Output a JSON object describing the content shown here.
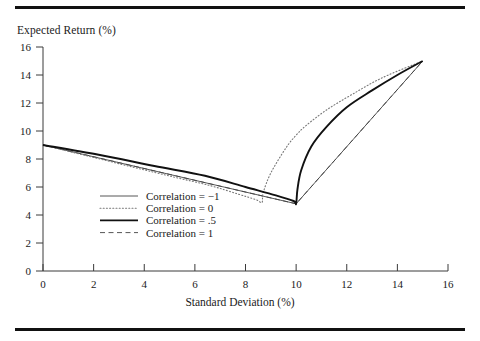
{
  "figure": {
    "title": "",
    "ylabel": "Expected Return (%)",
    "xlabel": "Standard Deviation (%)"
  },
  "legend": {
    "items": [
      {
        "label": "Correlation = −1",
        "style": "thin-solid",
        "key": "neg1"
      },
      {
        "label": "Correlation = 0",
        "style": "dotted",
        "key": "zero"
      },
      {
        "label": "Correlation = .5",
        "style": "thick-solid",
        "key": "half"
      },
      {
        "label": "Correlation = 1",
        "style": "dashed",
        "key": "one"
      }
    ]
  },
  "chart_data": {
    "type": "line",
    "title": "",
    "xlabel": "Standard Deviation (%)",
    "ylabel": "Expected Return (%)",
    "xlim": [
      0,
      16
    ],
    "ylim": [
      0,
      16
    ],
    "xticks": [
      0,
      2,
      4,
      6,
      8,
      10,
      12,
      14,
      16
    ],
    "yticks": [
      0,
      2,
      4,
      6,
      8,
      10,
      12,
      14,
      16
    ],
    "grid": false,
    "legend_position": "center-left",
    "endpoints": {
      "asset_a": {
        "x": 0,
        "y": 9
      },
      "asset_b": {
        "x": 15,
        "y": 15
      },
      "kink": {
        "x": 10,
        "y": 4.8
      }
    },
    "series": [
      {
        "name": "Correlation = −1",
        "style": "thin-solid",
        "x": [
          0,
          10,
          15
        ],
        "y": [
          9,
          4.8,
          15
        ]
      },
      {
        "name": "Correlation = 0",
        "style": "dotted",
        "x": [
          0,
          1.8,
          3.6,
          5.2,
          6.6,
          7.7,
          8.4,
          8.65,
          8.7,
          9.0,
          9.6,
          10.0,
          10.4,
          11.2,
          12.2,
          13.4,
          15
        ],
        "y": [
          9,
          8.2,
          7.4,
          6.7,
          6.1,
          5.5,
          5.1,
          4.9,
          5.6,
          7.0,
          8.8,
          9.7,
          10.4,
          11.5,
          12.6,
          13.8,
          15
        ]
      },
      {
        "name": "Correlation = .5",
        "style": "thick-solid",
        "x": [
          0,
          2.2,
          4.4,
          6.4,
          8.0,
          9.2,
          9.9,
          10.0,
          10.05,
          10.2,
          10.6,
          11.2,
          12.0,
          13.0,
          14.0,
          15
        ],
        "y": [
          9,
          8.3,
          7.5,
          6.8,
          6.0,
          5.4,
          5.0,
          4.8,
          5.8,
          7.2,
          8.9,
          10.3,
          11.7,
          12.9,
          14.0,
          15
        ]
      },
      {
        "name": "Correlation = 1",
        "style": "dashed",
        "x": [
          0,
          10,
          15
        ],
        "y": [
          9,
          4.8,
          15
        ]
      }
    ]
  }
}
